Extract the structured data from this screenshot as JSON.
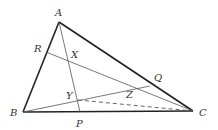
{
  "diagram": {
    "type": "triangle-geometry",
    "colors": {
      "stroke": "#222222",
      "thin": "#555555",
      "label": "#333333"
    },
    "points": {
      "A": {
        "x": 59,
        "y": 22,
        "label": "A",
        "lx": 55,
        "ly": 16
      },
      "B": {
        "x": 23,
        "y": 112,
        "label": "B",
        "lx": 11,
        "ly": 116
      },
      "C": {
        "x": 193,
        "y": 111,
        "label": "C",
        "lx": 199,
        "ly": 116
      },
      "P": {
        "x": 80,
        "y": 112,
        "label": "P",
        "lx": 77,
        "ly": 126
      },
      "R": {
        "x": 46,
        "y": 52,
        "label": "R",
        "lx": 35,
        "ly": 52
      },
      "Q": {
        "x": 150,
        "y": 86,
        "label": "Q",
        "lx": 155,
        "ly": 81
      },
      "X": {
        "x": 68,
        "y": 58,
        "label": "X",
        "lx": 70,
        "ly": 57
      },
      "Y": {
        "x": 78,
        "y": 100,
        "label": "Y",
        "lx": 67,
        "ly": 99
      },
      "Z": {
        "x": 131,
        "y": 89,
        "label": "Z",
        "lx": 127,
        "ly": 99
      }
    },
    "segments": [
      {
        "from": "A",
        "to": "B",
        "style": "thick"
      },
      {
        "from": "A",
        "to": "C",
        "style": "thick"
      },
      {
        "from": "B",
        "to": "C",
        "style": "thick"
      },
      {
        "from": "A",
        "to": "P",
        "style": "thin"
      },
      {
        "from": "R",
        "to": "C",
        "style": "thin"
      },
      {
        "from": "B",
        "to": "Q",
        "style": "thin"
      },
      {
        "from": "Y",
        "to": "C",
        "style": "dashed"
      }
    ]
  }
}
